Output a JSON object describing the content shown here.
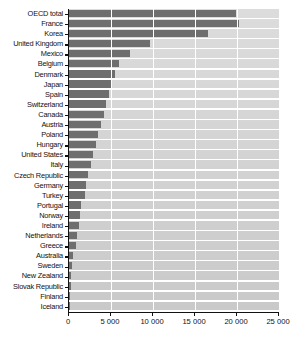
{
  "chart_data": {
    "type": "bar",
    "orientation": "horizontal",
    "title": "",
    "xlabel": "",
    "ylabel": "",
    "xlim": [
      0,
      25000
    ],
    "xticks": [
      0,
      5000,
      10000,
      15000,
      20000,
      25000
    ],
    "xticklabels": [
      "0",
      "5 000",
      "10 000",
      "15 000",
      "20 000",
      "25 000"
    ],
    "grid": "vertical",
    "legend": "none",
    "bar_color": "#6e6e6e",
    "plot_background": "#d4d4d4",
    "categories": [
      "OECD total",
      "France",
      "Korea",
      "United Kingdom",
      "Mexico",
      "Belgium",
      "Denmark",
      "Japan",
      "Spain",
      "Switzerland",
      "Canada",
      "Austria",
      "Poland",
      "Hungary",
      "United States",
      "Italy",
      "Czech Republic",
      "Germany",
      "Turkey",
      "Portugal",
      "Norway",
      "Ireland",
      "Netherlands",
      "Greece",
      "Australia",
      "Sweden",
      "New Zealand",
      "Slovak Republic",
      "Finland",
      "Iceland"
    ],
    "values": [
      19900,
      20200,
      16500,
      9600,
      7300,
      6000,
      5500,
      5100,
      4800,
      4400,
      4200,
      3800,
      3500,
      3200,
      2900,
      2600,
      2300,
      2050,
      1900,
      1400,
      1300,
      1200,
      950,
      850,
      500,
      320,
      260,
      210,
      160,
      110
    ]
  }
}
